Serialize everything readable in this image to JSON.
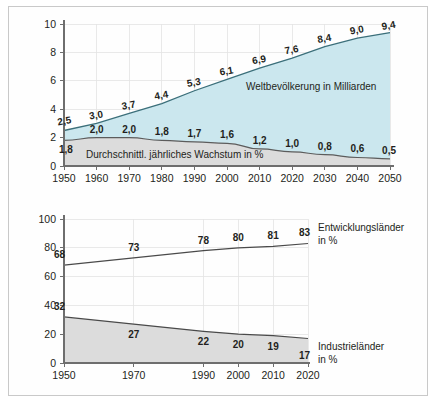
{
  "figure": {
    "background": "#ffffff",
    "frame_color": "#c9c9c9",
    "caption": ""
  },
  "colors": {
    "population_area": "#cbe7ee",
    "population_line": "#3b6f7a",
    "growth_area": "#dcdcdc",
    "growth_line": "#5c5c5c",
    "axis": "#6e6e6e",
    "grid": "#e3e3e3",
    "text": "#231f20"
  },
  "chart_data": [
    {
      "id": "top",
      "type": "area",
      "title": "",
      "xlabel": "",
      "ylabel": "",
      "x": [
        1950,
        1960,
        1970,
        1980,
        1990,
        2000,
        2010,
        2020,
        2030,
        2040,
        2050
      ],
      "xtick_labels": [
        "1950",
        "1960",
        "1970",
        "1980",
        "1990",
        "2000",
        "2010",
        "2020",
        "2030",
        "2040",
        "2050"
      ],
      "xlim": [
        1950,
        2050
      ],
      "ylim": [
        0,
        10
      ],
      "ytick_labels": [
        "0",
        "2",
        "4",
        "6",
        "8",
        "10"
      ],
      "yticks": [
        0,
        2,
        4,
        6,
        8,
        10
      ],
      "grid": true,
      "legend_position": "inline-annotation",
      "series": [
        {
          "name": "Weltbevölkerung in Milliarden",
          "annotation": "Weltbevölkerung in Milliarden",
          "fill": "#cbe7ee",
          "stroke": "#3b6f7a",
          "values": [
            2.5,
            3.0,
            3.7,
            4.4,
            5.3,
            6.1,
            6.9,
            7.6,
            8.4,
            9.0,
            9.4
          ],
          "value_labels": [
            "2,5",
            "3,0",
            "3,7",
            "4,4",
            "5,3",
            "6,1",
            "6,9",
            "7,6",
            "8,4",
            "9,0",
            "9,4"
          ]
        },
        {
          "name": "Durchschnittl. jährliches Wachstum in %",
          "annotation": "Durchschnittl. jährliches Wachstum in %",
          "fill": "#dcdcdc",
          "stroke": "#5c5c5c",
          "values": [
            1.8,
            2.0,
            2.0,
            1.8,
            1.7,
            1.6,
            1.2,
            1.0,
            0.8,
            0.6,
            0.5
          ],
          "value_labels": [
            "1,8",
            "2,0",
            "2,0",
            "1,8",
            "1,7",
            "1,6",
            "1,2",
            "1,0",
            "0,8",
            "0,6",
            "0,5"
          ]
        }
      ]
    },
    {
      "id": "bottom",
      "type": "line",
      "title": "",
      "xlabel": "",
      "ylabel": "",
      "x": [
        1950,
        1970,
        1990,
        2000,
        2010,
        2020
      ],
      "xtick_labels": [
        "1950",
        "1970",
        "1990",
        "2000",
        "2010",
        "2020"
      ],
      "xlim": [
        1950,
        2020
      ],
      "ylim": [
        0,
        100
      ],
      "ytick_labels": [
        "0",
        "20",
        "40",
        "60",
        "80",
        "100"
      ],
      "yticks": [
        0,
        20,
        40,
        60,
        80,
        100
      ],
      "grid": true,
      "legend_position": "right",
      "series": [
        {
          "name": "Entwicklungsländer in %",
          "label_line1": "Entwicklungsländer",
          "label_line2": "in %",
          "fill": "none",
          "stroke": "#4a4a4a",
          "values": [
            68,
            73,
            78,
            80,
            81,
            83
          ],
          "value_labels": [
            "68",
            "73",
            "78",
            "80",
            "81",
            "83"
          ]
        },
        {
          "name": "Industrieländer in %",
          "label_line1": "Industrieländer",
          "label_line2": "in %",
          "fill": "#dcdcdc",
          "stroke": "#4a4a4a",
          "values": [
            32,
            27,
            22,
            20,
            19,
            17
          ],
          "value_labels": [
            "32",
            "27",
            "22",
            "20",
            "19",
            "17"
          ]
        }
      ]
    }
  ]
}
